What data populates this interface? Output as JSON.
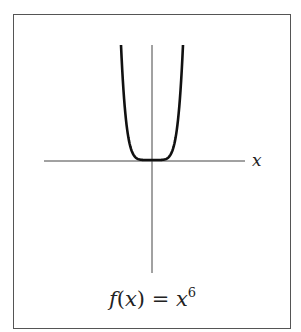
{
  "chart_data": {
    "type": "line",
    "function": "x^6",
    "xlabel": "x",
    "ylabel": "",
    "grid": false,
    "legend": "none",
    "x": [
      -1.0,
      -0.9,
      -0.8,
      -0.7,
      -0.6,
      -0.5,
      -0.4,
      -0.3,
      -0.2,
      -0.1,
      0,
      0.1,
      0.2,
      0.3,
      0.4,
      0.5,
      0.6,
      0.7,
      0.8,
      0.9,
      1.0
    ],
    "values": [
      1.0,
      0.531,
      0.262,
      0.118,
      0.047,
      0.016,
      0.004,
      0.001,
      0.0,
      0.0,
      0,
      0.0,
      0.0,
      0.001,
      0.004,
      0.016,
      0.047,
      0.118,
      0.262,
      0.531,
      1.0
    ],
    "xlim": [
      -3.3,
      3.0
    ],
    "ylim": [
      -1.0,
      1.0
    ]
  },
  "axis": {
    "x_label": "x"
  },
  "caption": {
    "f": "f",
    "open": "(",
    "var": "x",
    "close": ")",
    "eq": " = ",
    "base": "x",
    "exp": "6"
  }
}
